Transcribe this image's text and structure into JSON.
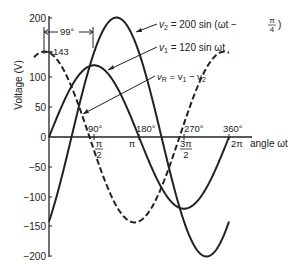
{
  "chart_data": {
    "type": "line",
    "title": "",
    "xlabel": "angle ωt",
    "ylabel": "Voltage (V)",
    "ylim": [
      -200,
      200
    ],
    "xlim_deg": [
      -30,
      400
    ],
    "yticks": [
      200,
      150,
      100,
      50,
      0,
      -50,
      -100,
      -150,
      -200
    ],
    "ytick_labels": [
      "200",
      "150",
      "100",
      "50",
      "0",
      "−50",
      "−100",
      "−150",
      "−200"
    ],
    "xticks_deg": [
      90,
      180,
      270,
      360
    ],
    "xtick_labels_deg": [
      "90°",
      "180°",
      "270°",
      "360°"
    ],
    "xtick_labels_rad": [
      "π/2",
      "π",
      "3π/2",
      "2π"
    ],
    "grid": false,
    "series": [
      {
        "name": "v2",
        "label": "v₂ = 200 sin (ωt − π/4)",
        "amplitude": 200,
        "phase_deg": -45,
        "style": "solid",
        "x_range_deg": [
          0,
          360
        ]
      },
      {
        "name": "v1",
        "label": "v₁ = 120 sin ωt",
        "amplitude": 120,
        "phase_deg": 0,
        "style": "solid",
        "x_range_deg": [
          0,
          360
        ]
      },
      {
        "name": "vR",
        "label": "vR = v₁ − v₂",
        "amplitude": 143,
        "phase_deg": 99,
        "style": "dashed",
        "x_range_deg": [
          -30,
          360
        ]
      }
    ],
    "annotations": [
      {
        "text": "143",
        "note": "peak of vR at ωt = −9°"
      },
      {
        "text": "99°",
        "note": "phase difference marker"
      }
    ]
  },
  "labels": {
    "ylabel": "Voltage (V)",
    "xlabel": "angle ωt",
    "peak": "143",
    "phase": "99°",
    "v2_a": "v",
    "v2_sub": "2",
    "v2_b": " = 200 sin (ωt − ",
    "v2_c": ")",
    "v1_a": "v",
    "v1_sub": "1",
    "v1_b": " = 120 sin ωt",
    "vr_a": "v",
    "vr_sub": "R",
    "vr_b": " = v",
    "vr_sub1": "1",
    "vr_c": " − v",
    "vr_sub2": "2",
    "pi": "π",
    "four": "4",
    "two": "2",
    "threepi": "3π",
    "twopi": "2π",
    "deg90": "90°",
    "deg180": "180°",
    "deg270": "270°",
    "deg360": "360°",
    "t200": "200",
    "t100": "100",
    "t50": "50",
    "t0": "0",
    "tm50": "−50",
    "tm100": "−100",
    "tm150": "−150",
    "tm200": "−200"
  }
}
